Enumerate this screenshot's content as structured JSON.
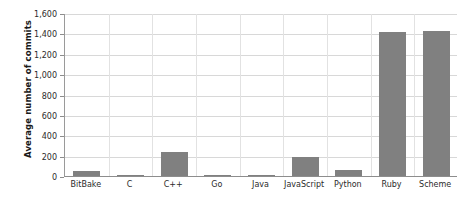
{
  "chart_data": {
    "type": "bar",
    "title": "",
    "xlabel": "",
    "ylabel": "Average number of commits",
    "categories": [
      "BitBake",
      "C",
      "C++",
      "Go",
      "Java",
      "JavaScript",
      "Python",
      "Ruby",
      "Scheme"
    ],
    "values": [
      50,
      2,
      240,
      3,
      3,
      185,
      60,
      1415,
      1425
    ],
    "ylim": [
      0,
      1600
    ],
    "yticks": [
      0,
      200,
      400,
      600,
      800,
      1000,
      1200,
      1400,
      1600
    ],
    "ytick_labels": [
      "0",
      "200",
      "400",
      "600",
      "800",
      "1,000",
      "1,200",
      "1,400",
      "1,600"
    ],
    "grid": true,
    "legend": false,
    "bar_color": "#808080",
    "grid_color": "#d8d8d8",
    "axis_color": "#8d8d8d",
    "background": "#ffffff"
  }
}
